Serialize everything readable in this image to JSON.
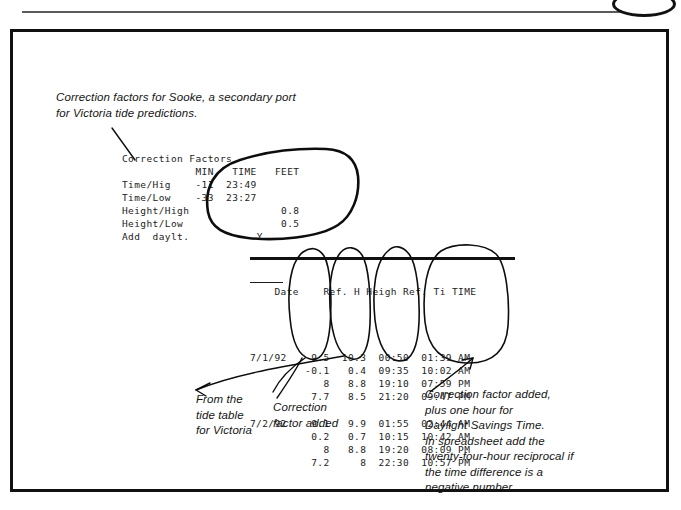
{
  "captions": {
    "intro": "Correction factors for Sooke, a secondary port\nfor Victoria tide predictions.",
    "from_tide_table": "From the\ntide table\nfor Victoria",
    "correction_added": "Correction\nfactor added",
    "daylight_savings": "Correction factor added,\nplus one hour for\nDaylight Savings Time.\nIn spreadsheet add the\ntwenty-four-hour reciprocal if\nthe time difference is a\nnegative number."
  },
  "correction_factors": {
    "title": "Correction Factors",
    "columns": [
      "MIN",
      "TIME",
      "FEET"
    ],
    "block_text": "Correction Factors\n            MIN   TIME   FEET\nTime/Hig    -11  23:49\nTime/Low    -33  23:27\nHeight/High               0.8\nHeight/Low                0.5\nAdd  daylt.           Y",
    "rows": [
      {
        "label": "Time/Hig",
        "min": "-11",
        "time": "23:49",
        "feet": ""
      },
      {
        "label": "Time/Low",
        "min": "-33",
        "time": "23:27",
        "feet": ""
      },
      {
        "label": "Height/High",
        "min": "",
        "time": "",
        "feet": "0.8"
      },
      {
        "label": "Height/Low",
        "min": "",
        "time": "",
        "feet": "0.5"
      },
      {
        "label": "Add  daylt.",
        "min": "",
        "time": "Y",
        "feet": ""
      }
    ]
  },
  "tide_table": {
    "headers": [
      "Date",
      "Ref. H",
      "Heigh",
      "Ref. Ti",
      "TIME"
    ],
    "header_text": "Date    Ref. H Heigh Ref. Ti TIME",
    "body_text": "7/1/92    9.5  10.3  00:50  01:39 AM\n         -0.1   0.4  09:35  10:02 AM\n            8   8.8  19:10  07:59 PM\n          7.7   8.5  21:20  09:47 PM\n\n7/2/92    9.1   9.9  01:55  02:44 AM\n          0.2   0.7  10:15  10:42 AM\n            8   8.8  19:20  08:09 PM\n          7.2     8  22:30  10:57 PM",
    "groups": [
      {
        "date": "7/1/92",
        "rows": [
          {
            "ref_height": "9.5",
            "height": "10.3",
            "ref_time": "00:50",
            "time": "01:39",
            "meridiem": "AM"
          },
          {
            "ref_height": "-0.1",
            "height": "0.4",
            "ref_time": "09:35",
            "time": "10:02",
            "meridiem": "AM"
          },
          {
            "ref_height": "8",
            "height": "8.8",
            "ref_time": "19:10",
            "time": "07:59",
            "meridiem": "PM"
          },
          {
            "ref_height": "7.7",
            "height": "8.5",
            "ref_time": "21:20",
            "time": "09:47",
            "meridiem": "PM"
          }
        ]
      },
      {
        "date": "7/2/92",
        "rows": [
          {
            "ref_height": "9.1",
            "height": "9.9",
            "ref_time": "01:55",
            "time": "02:44",
            "meridiem": "AM"
          },
          {
            "ref_height": "0.2",
            "height": "0.7",
            "ref_time": "10:15",
            "time": "10:42",
            "meridiem": "AM"
          },
          {
            "ref_height": "8",
            "height": "8.8",
            "ref_time": "19:20",
            "time": "08:09",
            "meridiem": "PM"
          },
          {
            "ref_height": "7.2",
            "height": "8",
            "ref_time": "22:30",
            "time": "10:57",
            "meridiem": "PM"
          }
        ]
      }
    ]
  },
  "annotations": {
    "oval_count": 5,
    "ink_color": "#0d0d0d",
    "frame_color": "#111111"
  }
}
